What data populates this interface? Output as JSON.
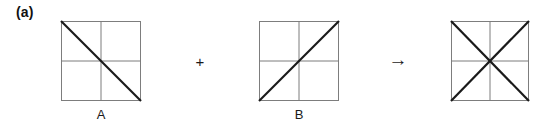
{
  "figure": {
    "panel_label": "(a)",
    "background_color": "#ffffff",
    "grid_color": "#7d7d7d",
    "diagonal_color": "#1a1a1a",
    "border_color": "#7d7d7d",
    "text_color": "#1a1a1a"
  },
  "operands": {
    "plus_symbol": "+",
    "arrow_symbol": "→"
  },
  "tiles": [
    {
      "id": "tile-a",
      "caption": "A",
      "strokes": [
        "border",
        "vertical-midline",
        "horizontal-midline",
        "anti-diagonal"
      ],
      "description": "square with cross and thick diagonal from top-left to bottom-right"
    },
    {
      "id": "tile-b",
      "caption": "B",
      "strokes": [
        "border",
        "vertical-midline",
        "horizontal-midline",
        "main-diagonal"
      ],
      "description": "square with cross and thick diagonal from bottom-left to top-right"
    },
    {
      "id": "tile-result",
      "caption": "",
      "strokes": [
        "border",
        "vertical-midline",
        "horizontal-midline",
        "anti-diagonal",
        "main-diagonal"
      ],
      "description": "square with cross and both diagonals forming an eight-spoke star"
    }
  ]
}
